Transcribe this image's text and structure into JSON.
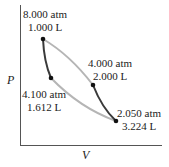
{
  "diagram": {
    "type": "PV diagram (Carnot-like cycle)",
    "axes": {
      "x_label": "V",
      "y_label": "P"
    },
    "points": [
      {
        "id": "A",
        "pressure": "8.000 atm",
        "volume": "1.000 L"
      },
      {
        "id": "B",
        "pressure": "4.100 atm",
        "volume": "1.612 L"
      },
      {
        "id": "C",
        "pressure": "4.000 atm",
        "volume": "2.000 L"
      },
      {
        "id": "D",
        "pressure": "2.050 atm",
        "volume": "3.224 L"
      }
    ],
    "colors": {
      "adiabat": "#3a3a3a",
      "isotherm": "#b5b5b5",
      "point": "#111111",
      "axis": "#555555"
    }
  }
}
